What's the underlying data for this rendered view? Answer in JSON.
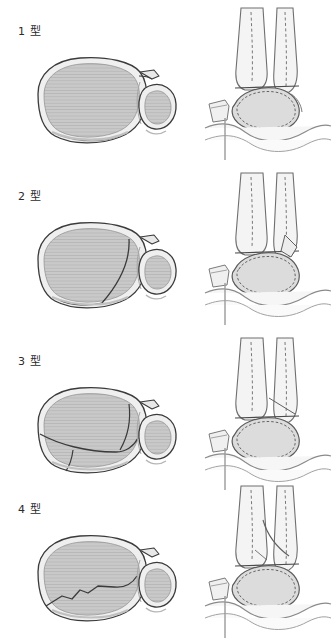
{
  "figure": {
    "kind": "medical-illustration",
    "description_rows": 4,
    "views_per_row": 2
  },
  "rows": [
    {
      "label": "1 型",
      "axial_name": "axial-cross-section-type-1",
      "lateral_name": "lateral-ankle-view-type-1",
      "fracture_pattern": "intact-articular-surface"
    },
    {
      "label": "2 型",
      "axial_name": "axial-cross-section-type-2",
      "lateral_name": "lateral-ankle-view-type-2",
      "fracture_pattern": "posterolateral-fragment"
    },
    {
      "label": "3 型",
      "axial_name": "axial-cross-section-type-3",
      "lateral_name": "lateral-ankle-view-type-3",
      "fracture_pattern": "anteromedial-and-posterior-fragments"
    },
    {
      "label": "4 型",
      "axial_name": "axial-cross-section-type-4",
      "lateral_name": "lateral-ankle-view-type-4",
      "fracture_pattern": "central-comminuted-split"
    }
  ],
  "colors": {
    "page_background": "#ffffff",
    "outline": "#3b3b3b",
    "bone_fill": "#c9c9c9",
    "bone_fill_light": "#e3e3e3",
    "cortex_fill": "#efefef",
    "hatch": "#b4b4b4",
    "soft_tissue": "#f2f2f2",
    "dashed_line": "#6a6a6a",
    "label_text": "#2b2b2b"
  }
}
